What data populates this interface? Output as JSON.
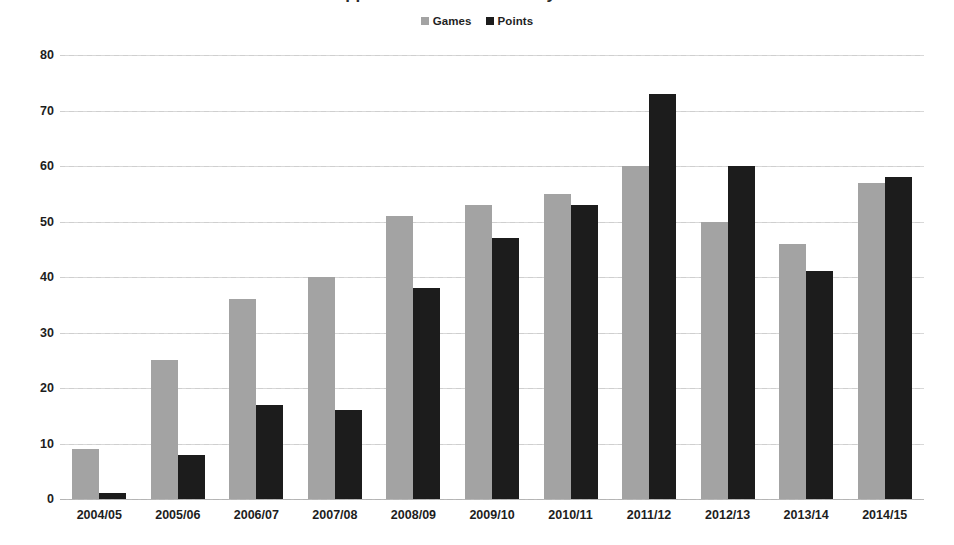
{
  "title": {
    "text": "Appearances and Points by Season",
    "cropped": true
  },
  "legend": {
    "position": "top-center",
    "entries": [
      {
        "label": "Games",
        "color": "#a3a3a3",
        "icon": "square-swatch-icon"
      },
      {
        "label": "Points",
        "color": "#1c1c1c",
        "icon": "square-swatch-icon"
      }
    ]
  },
  "axis": {
    "y_ticks": [
      "0",
      "10",
      "20",
      "30",
      "40",
      "50",
      "60",
      "70",
      "80"
    ],
    "x_ticks": [
      "2004/05",
      "2005/06",
      "2006/07",
      "2007/08",
      "2008/09",
      "2009/10",
      "2010/11",
      "2011/12",
      "2012/13",
      "2013/14",
      "2014/15"
    ]
  },
  "chart_data": {
    "type": "bar",
    "title": "Appearances and Points by Season",
    "xlabel": "",
    "ylabel": "",
    "ylim": [
      0,
      80
    ],
    "ystep": 10,
    "grid": true,
    "legend_position": "top-center",
    "categories": [
      "2004/05",
      "2005/06",
      "2006/07",
      "2007/08",
      "2008/09",
      "2009/10",
      "2010/11",
      "2011/12",
      "2012/13",
      "2013/14",
      "2014/15"
    ],
    "series": [
      {
        "name": "Games",
        "color": "#a3a3a3",
        "values": [
          9,
          25,
          36,
          40,
          51,
          53,
          55,
          60,
          50,
          46,
          57
        ]
      },
      {
        "name": "Points",
        "color": "#1c1c1c",
        "values": [
          1,
          8,
          17,
          16,
          38,
          47,
          53,
          73,
          60,
          41,
          58
        ]
      }
    ]
  }
}
